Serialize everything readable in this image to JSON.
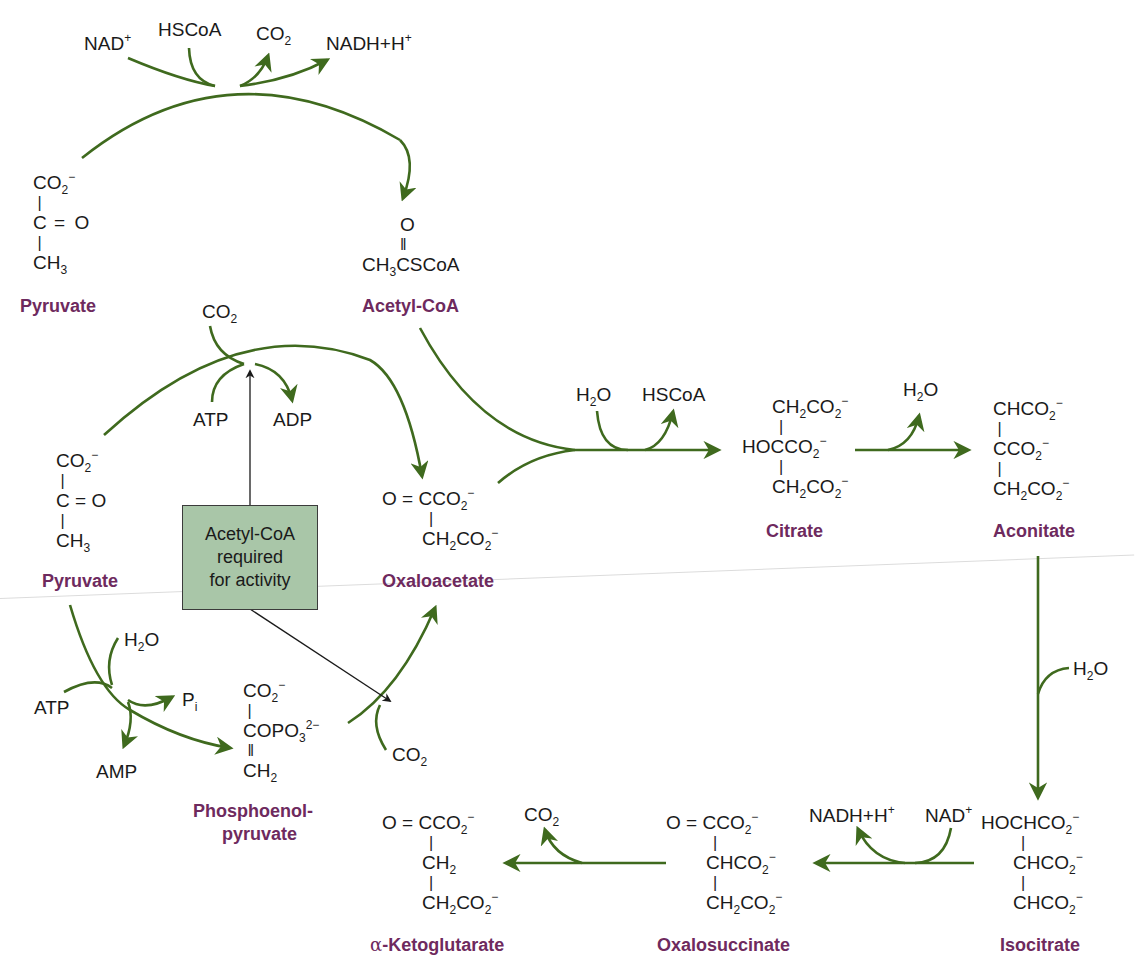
{
  "colors": {
    "arrow": "#3f6a1e",
    "compound_label": "#6e2a5e",
    "box_fill": "#a9c6a8",
    "regulator_arrow": "#1a1a1a"
  },
  "reactions": {
    "pdh": {
      "inputs": [
        "NAD+",
        "HSCoA"
      ],
      "outputs": [
        "CO2",
        "NADH+H+"
      ],
      "from": "Pyruvate",
      "to": "Acetyl-CoA"
    },
    "pyruvate_carboxylase": {
      "inputs": [
        "CO2",
        "ATP"
      ],
      "outputs": [
        "ADP"
      ],
      "from": "Pyruvate",
      "to": "Oxaloacetate",
      "regulator": "Acetyl-CoA required for activity"
    },
    "citrate_synthase": {
      "inputs": [
        "H2O"
      ],
      "outputs": [
        "HSCoA"
      ],
      "from": [
        "Acetyl-CoA",
        "Oxaloacetate"
      ],
      "to": "Citrate"
    },
    "aconitase_1": {
      "outputs": [
        "H2O"
      ],
      "from": "Citrate",
      "to": "Aconitate"
    },
    "aconitase_2": {
      "inputs": [
        "H2O"
      ],
      "from": "Aconitate",
      "to": "Isocitrate"
    },
    "isocitrate_dh": {
      "inputs": [
        "NAD+"
      ],
      "outputs": [
        "NADH+H+"
      ],
      "from": "Isocitrate",
      "to": "Oxalosuccinate"
    },
    "decarboxylation": {
      "outputs": [
        "CO2"
      ],
      "from": "Oxalosuccinate",
      "to": "α-Ketoglutarate"
    },
    "ppdk": {
      "inputs": [
        "ATP",
        "H2O"
      ],
      "outputs": [
        "AMP",
        "Pi"
      ],
      "from": "Pyruvate",
      "to": "Phosphoenolpyruvate"
    },
    "pep_carboxylase": {
      "inputs": [
        "CO2"
      ],
      "from": "Phosphoenolpyruvate",
      "to": "Oxaloacetate"
    }
  },
  "labels": {
    "pyruvate_top": "Pyruvate",
    "acetyl_coa": "Acetyl-CoA",
    "pyruvate_mid": "Pyruvate",
    "oxaloacetate": "Oxaloacetate",
    "citrate": "Citrate",
    "aconitate": "Aconitate",
    "pep_line1": "Phosphoenol-",
    "pep_line2": "pyruvate",
    "akg_prefix": "α",
    "akg_rest": "-Ketoglutarate",
    "oxalosuccinate": "Oxalosuccinate",
    "isocitrate": "Isocitrate"
  },
  "box": {
    "line1": "Acetyl-CoA",
    "line2": "required",
    "line3": "for activity"
  },
  "cofactors": {
    "nad": "NAD",
    "nadh": "NADH+H",
    "plus": "+",
    "hscoa": "HSCoA",
    "co": "CO",
    "h": "H",
    "o": "O",
    "two": "2",
    "atp": "ATP",
    "adp": "ADP",
    "amp": "AMP",
    "p": "P",
    "i": "i"
  }
}
